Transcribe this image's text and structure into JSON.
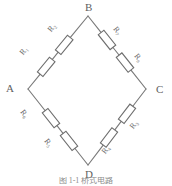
{
  "figure": {
    "caption": "图 1-1  桥式电路",
    "background_color": "#ffffff",
    "line_color": "#7a7a7a",
    "text_color": "#6a6a6a"
  },
  "vertices": [
    {
      "id": "A",
      "label": "A",
      "position": "left"
    },
    {
      "id": "B",
      "label": "B",
      "position": "top"
    },
    {
      "id": "C",
      "label": "C",
      "position": "right"
    },
    {
      "id": "D",
      "label": "D",
      "position": "bottom"
    }
  ],
  "branches": [
    {
      "id": "AB",
      "from": "A",
      "to": "B",
      "resistors": [
        {
          "id": "R1",
          "label": "R",
          "subscript": "1"
        },
        {
          "id": "R2",
          "label": "R",
          "subscript": "2"
        }
      ]
    },
    {
      "id": "BC",
      "from": "B",
      "to": "C",
      "resistors": [
        {
          "id": "R7",
          "label": "R",
          "subscript": "7"
        },
        {
          "id": "R8",
          "label": "R",
          "subscript": "8"
        }
      ]
    },
    {
      "id": "CD",
      "from": "C",
      "to": "D",
      "resistors": [
        {
          "id": "R3",
          "label": "R",
          "subscript": "3"
        },
        {
          "id": "R4",
          "label": "R",
          "subscript": "4"
        }
      ]
    },
    {
      "id": "DA",
      "from": "D",
      "to": "A",
      "resistors": [
        {
          "id": "R5",
          "label": "R",
          "subscript": "5"
        },
        {
          "id": "R6",
          "label": "R",
          "subscript": "6"
        }
      ]
    }
  ],
  "resistor_labels": {
    "R1": "R₁",
    "R2": "R₂",
    "R3": "R₃",
    "R4": "R₄",
    "R5": "R₅",
    "R6": "R₆",
    "R7": "R₇",
    "R8": "R₈"
  }
}
